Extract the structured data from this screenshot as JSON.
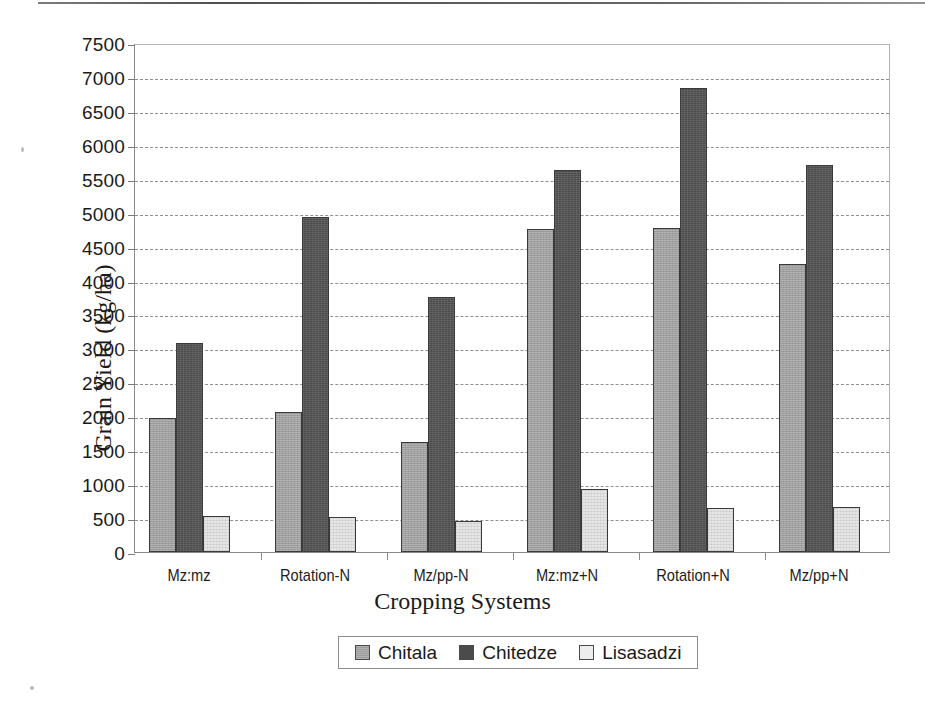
{
  "chart_data": {
    "type": "bar",
    "title": "",
    "xlabel": "Cropping Systems",
    "ylabel": "Grain Yield (kg/ha)",
    "categories": [
      "Mz:mz",
      "Rotation-N",
      "Mz/pp-N",
      "Mz:mz+N",
      "Rotation+N",
      "Mz/pp+N"
    ],
    "series": [
      {
        "name": "Chitala",
        "color": "#9d9d9d",
        "values": [
          1970,
          2070,
          1620,
          4760,
          4780,
          4250
        ]
      },
      {
        "name": "Chitedze",
        "color": "#4b4b4b",
        "values": [
          3080,
          4930,
          3760,
          5630,
          6840,
          5700
        ]
      },
      {
        "name": "Lisasadzi",
        "color": "#e6e6e6",
        "values": [
          530,
          520,
          450,
          930,
          650,
          660
        ]
      }
    ],
    "ylim": [
      0,
      7500
    ],
    "ytick_step": 500,
    "yticks": [
      0,
      500,
      1000,
      1500,
      2000,
      2500,
      3000,
      3500,
      4000,
      4500,
      5000,
      5500,
      6000,
      6500,
      7000,
      7500
    ],
    "ytick_labels": [
      "0",
      "500",
      "1000",
      "1500",
      "2000",
      "2500",
      "3000",
      "3500",
      "4000",
      "4500",
      "5000",
      "5500",
      "6000",
      "6500",
      "7000",
      "7500"
    ],
    "grid": true,
    "grid_style": "dashed",
    "legend_position": "bottom"
  }
}
